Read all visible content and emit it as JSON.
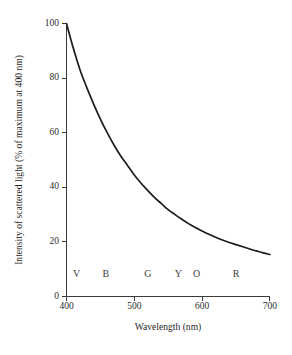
{
  "chart_data": {
    "type": "line",
    "title": "",
    "xlabel": "Wavelength (nm)",
    "ylabel": "Intensity of scattered light (% of maximum at 400 nm)",
    "xlim": [
      400,
      700
    ],
    "ylim": [
      0,
      100
    ],
    "grid": false,
    "legend": "none",
    "xticks": [
      "400",
      "500",
      "600",
      "700"
    ],
    "xtick_values": [
      400,
      500,
      600,
      700
    ],
    "yticks": [
      "0",
      "20",
      "40",
      "60",
      "80",
      "100"
    ],
    "ytick_values": [
      0,
      20,
      40,
      60,
      80,
      100
    ],
    "line_color": "#1c1c1c",
    "axis_color": "#3a3a3a",
    "background": "#ffffff",
    "series": [
      {
        "name": "Intensity of scattered light",
        "x": [
          400,
          410,
          420,
          430,
          440,
          450,
          460,
          470,
          480,
          490,
          500,
          510,
          520,
          530,
          540,
          550,
          560,
          570,
          580,
          590,
          600,
          610,
          620,
          630,
          640,
          650,
          660,
          670,
          680,
          690,
          700
        ],
        "values": [
          100,
          91,
          83,
          76.5,
          70.5,
          65,
          60,
          55.5,
          51.5,
          48,
          44.5,
          41.5,
          38.8,
          36.2,
          34,
          31.8,
          30,
          28.3,
          26.7,
          25.3,
          24,
          22.8,
          21.7,
          20.7,
          19.8,
          19,
          18.2,
          17.4,
          16.7,
          16,
          15.4
        ]
      }
    ],
    "annotations": [
      {
        "label": "V",
        "x": 415,
        "note": "violet band marker"
      },
      {
        "label": "B",
        "x": 458,
        "note": "blue band marker"
      },
      {
        "label": "G",
        "x": 520,
        "note": "green band marker"
      },
      {
        "label": "Y",
        "x": 565,
        "note": "yellow band marker"
      },
      {
        "label": "O",
        "x": 592,
        "note": "orange band marker"
      },
      {
        "label": "R",
        "x": 650,
        "note": "red band marker"
      }
    ],
    "annotation_y": 7
  }
}
